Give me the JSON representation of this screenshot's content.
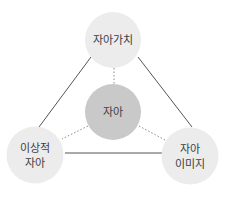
{
  "colors": {
    "outer_fill": "#ececec",
    "center_fill": "#c9c9c9",
    "line": "#555555",
    "dotted": "#8a8a8a",
    "text": "#3d3d3d"
  },
  "nodes": {
    "top": {
      "lines": [
        "자아가치"
      ]
    },
    "center": {
      "lines": [
        "자아"
      ]
    },
    "left": {
      "lines": [
        "이상적",
        "자아"
      ]
    },
    "right": {
      "lines": [
        "자아",
        "이미지"
      ]
    }
  }
}
